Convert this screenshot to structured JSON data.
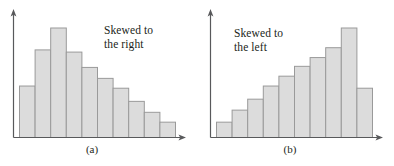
{
  "figure": {
    "background_color": "#ffffff",
    "bar_fill_color": "#dcdcdc",
    "bar_stroke_color": "#9a9a9a",
    "axis_color": "#58595b",
    "text_color": "#231f20"
  },
  "panels": [
    {
      "id": "a",
      "caption": "(a)",
      "annotation_line1": "Skewed to",
      "annotation_line2": "the right"
    },
    {
      "id": "b",
      "caption": "(b)",
      "annotation_line1": "Skewed to",
      "annotation_line2": "the left"
    }
  ],
  "chart_data": [
    {
      "type": "bar",
      "title": "Skewed to the right",
      "panel_label": "(a)",
      "xlabel": "",
      "ylabel": "",
      "grid": false,
      "legend": "none",
      "axis_style": "arrow-axes",
      "categories": [
        "1",
        "2",
        "3",
        "4",
        "5",
        "6",
        "7",
        "8",
        "9",
        "10"
      ],
      "values": [
        47,
        80,
        100,
        78,
        64,
        54,
        45,
        33,
        23,
        14
      ],
      "ylim": [
        0,
        110
      ],
      "skew": "right",
      "n_bars": 10
    },
    {
      "type": "bar",
      "title": "Skewed to the left",
      "panel_label": "(b)",
      "xlabel": "",
      "ylabel": "",
      "grid": false,
      "legend": "none",
      "axis_style": "arrow-axes",
      "categories": [
        "1",
        "2",
        "3",
        "4",
        "5",
        "6",
        "7",
        "8",
        "9",
        "10"
      ],
      "values": [
        14,
        25,
        35,
        47,
        56,
        65,
        73,
        82,
        100,
        45
      ],
      "ylim": [
        0,
        110
      ],
      "skew": "left",
      "n_bars": 10
    }
  ]
}
